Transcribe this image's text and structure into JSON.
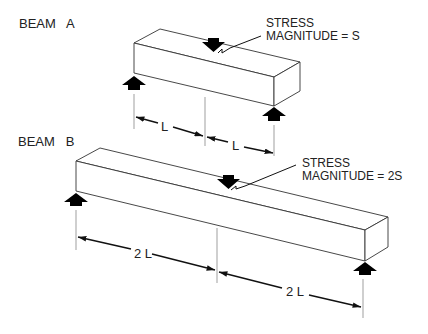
{
  "beam_a": {
    "title": "BEAM   A",
    "stress_line1": "STRESS",
    "stress_line2": "MAGNITUDE = S",
    "span_left": "L",
    "span_right": "L"
  },
  "beam_b": {
    "title": "BEAM   B",
    "stress_line1": "STRESS",
    "stress_line2": "MAGNITUDE = 2S",
    "span_left": "2 L",
    "span_right": "2 L"
  },
  "colors": {
    "line": "#333333",
    "arrow": "#000000",
    "text": "#222222"
  }
}
